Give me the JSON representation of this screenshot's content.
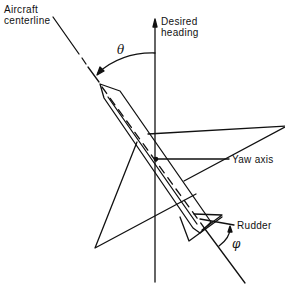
{
  "figure": {
    "type": "aircraft yaw control diagram",
    "labels": {
      "aircraft_centerline": "Aircraft\ncenterline",
      "desired_heading": "Desired\nheading",
      "yaw_axis": "Yaw axis",
      "rudder": "Rudder"
    },
    "symbols": {
      "theta": "θ",
      "phi": "φ"
    },
    "colors": {
      "line": "#111111",
      "background": "#ffffff"
    }
  }
}
